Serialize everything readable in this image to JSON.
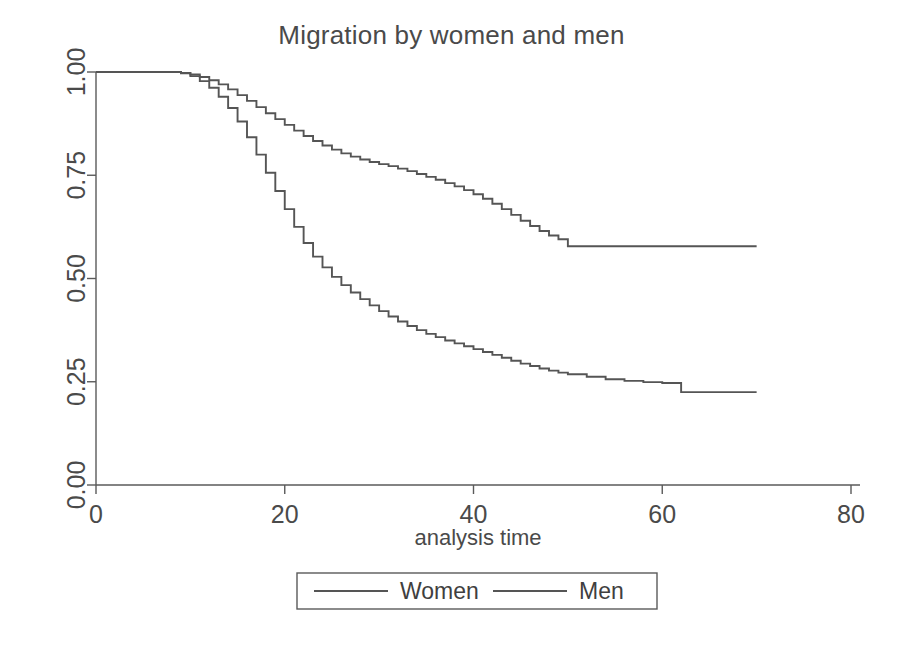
{
  "chart_data": {
    "type": "line",
    "title": "Migration by women and men",
    "subtitle": "",
    "xlabel": "analysis time",
    "ylabel": "",
    "xlim": [
      0,
      80
    ],
    "ylim": [
      0,
      1.0
    ],
    "xticks": [
      0,
      20,
      40,
      60,
      80
    ],
    "xtick_labels": [
      "0",
      "20",
      "40",
      "60",
      "80"
    ],
    "yticks": [
      0.0,
      0.25,
      0.5,
      0.75,
      1.0
    ],
    "ytick_labels": [
      "0.00",
      "0.25",
      "0.50",
      "0.75",
      "1.00"
    ],
    "grid": false,
    "legend_position": "bottom-center",
    "step_type": "post",
    "annotations": [],
    "series": [
      {
        "name": "Women",
        "color": "#555555",
        "x": [
          0,
          2,
          4,
          6,
          8,
          9,
          10,
          11,
          12,
          13,
          14,
          15,
          16,
          17,
          18,
          19,
          20,
          21,
          22,
          23,
          24,
          25,
          26,
          27,
          28,
          29,
          30,
          31,
          32,
          33,
          34,
          35,
          36,
          37,
          38,
          39,
          40,
          41,
          42,
          43,
          44,
          45,
          46,
          47,
          48,
          49,
          50,
          55,
          60,
          65,
          70
        ],
        "values": [
          1.0,
          1.0,
          1.0,
          1.0,
          1.0,
          0.998,
          0.994,
          0.988,
          0.98,
          0.97,
          0.958,
          0.944,
          0.93,
          0.915,
          0.9,
          0.886,
          0.872,
          0.858,
          0.845,
          0.833,
          0.822,
          0.812,
          0.803,
          0.795,
          0.788,
          0.782,
          0.777,
          0.772,
          0.766,
          0.76,
          0.753,
          0.746,
          0.739,
          0.731,
          0.723,
          0.714,
          0.704,
          0.693,
          0.681,
          0.668,
          0.654,
          0.64,
          0.627,
          0.615,
          0.604,
          0.595,
          0.578,
          0.578,
          0.578,
          0.578,
          0.578
        ]
      },
      {
        "name": "Men",
        "color": "#555555",
        "x": [
          0,
          2,
          4,
          6,
          8,
          9,
          10,
          11,
          12,
          13,
          14,
          15,
          16,
          17,
          18,
          19,
          20,
          21,
          22,
          23,
          24,
          25,
          26,
          27,
          28,
          29,
          30,
          31,
          32,
          33,
          34,
          35,
          36,
          37,
          38,
          39,
          40,
          41,
          42,
          43,
          44,
          45,
          46,
          47,
          48,
          49,
          50,
          52,
          54,
          56,
          58,
          60,
          62,
          65,
          70
        ],
        "values": [
          1.0,
          1.0,
          1.0,
          1.0,
          1.0,
          0.997,
          0.99,
          0.978,
          0.962,
          0.94,
          0.913,
          0.88,
          0.842,
          0.8,
          0.756,
          0.712,
          0.668,
          0.625,
          0.586,
          0.553,
          0.527,
          0.504,
          0.484,
          0.466,
          0.45,
          0.435,
          0.421,
          0.408,
          0.396,
          0.385,
          0.375,
          0.366,
          0.358,
          0.35,
          0.343,
          0.336,
          0.329,
          0.322,
          0.315,
          0.308,
          0.301,
          0.294,
          0.288,
          0.282,
          0.277,
          0.272,
          0.268,
          0.262,
          0.256,
          0.252,
          0.249,
          0.247,
          0.225,
          0.225,
          0.225
        ]
      }
    ],
    "legend": [
      {
        "label": "Women",
        "color": "#555555"
      },
      {
        "label": "Men",
        "color": "#555555"
      }
    ]
  },
  "figure": {
    "background": "#ffffff",
    "axis_color": "#5a5a5a",
    "text_color": "#4a4a4a"
  }
}
